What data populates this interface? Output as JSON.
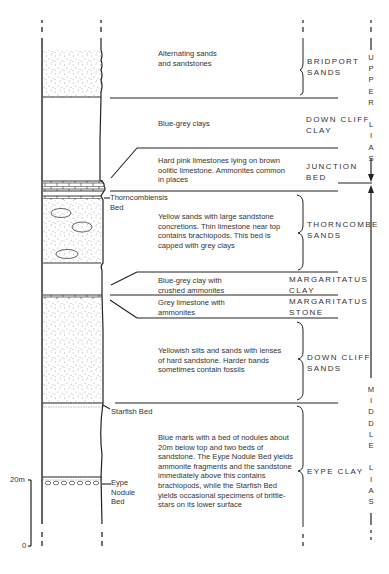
{
  "diagram": {
    "scale": {
      "top_label": "20m",
      "bottom_label": "0"
    },
    "units": [
      {
        "id": "bridport",
        "name_line1": "BRIDPORT",
        "name_line2": "SANDS",
        "description": "Alternating sands\nand sandstones"
      },
      {
        "id": "downcliff-clay",
        "name_line1": "DOWN CLIFF",
        "name_line2": "CLAY",
        "description": "Blue-grey clays"
      },
      {
        "id": "junction",
        "name_line1": "JUNCTION",
        "name_line2": "BED",
        "description": "Hard pink limestones lying on brown\noolitic limestone. Ammonites common\nin places"
      },
      {
        "id": "thorncombe",
        "name_line1": "THORNCOMBE",
        "name_line2": "SANDS",
        "description": "Yellow sands with large sandstone\nconcretions. Thin limestone near top\ncontains brachiopods. This bed is\ncapped with grey clays"
      },
      {
        "id": "margaritatus-clay",
        "name_line1": "MARGARITATUS",
        "name_line2": "CLAY",
        "description": "Blue-grey clay with\ncrushed ammonites"
      },
      {
        "id": "margaritatus-stone",
        "name_line1": "MARGARITATUS",
        "name_line2": "STONE",
        "description": "Grey limestone with\nammonites"
      },
      {
        "id": "downcliff-sands",
        "name_line1": "DOWN CLIFF",
        "name_line2": "SANDS",
        "description": "Yellowish silts and sands with lenses\nof hard sandstone. Harder bands\nsometimes contain fossils"
      },
      {
        "id": "eype-clay",
        "name_line1": "EYPE CLAY",
        "name_line2": "",
        "description": "Blue marls with a bed of nodules about\n20m below top and two beds of\nsandstone. The Eype Nodule Bed yields\nammonite fragments and the sandstone\nimmediately above this contains\nbrachiopods, while the Starfish Bed\nyields occasional specimens of brittle-\nstars on its lower surface"
      }
    ],
    "bed_labels": {
      "thorncombiensis": "Thorncombiensis\nBed",
      "starfish": "Starfish Bed",
      "eype_nodule": "Eype\nNodule\nBed"
    },
    "stages": {
      "upper": [
        "U",
        "P",
        "P",
        "E",
        "R",
        "",
        "L",
        "I",
        "A",
        "S"
      ],
      "middle": [
        "M",
        "I",
        "D",
        "D",
        "L",
        "E",
        "",
        "L",
        "I",
        "A",
        "S"
      ]
    }
  }
}
